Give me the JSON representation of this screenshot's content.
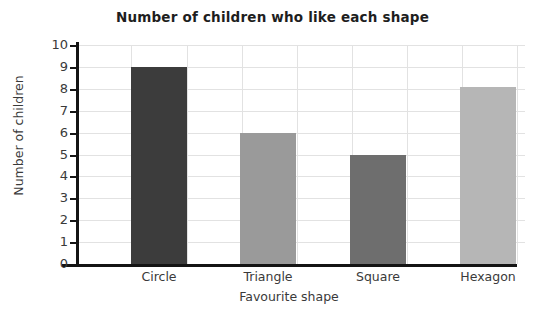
{
  "chart_data": {
    "type": "bar",
    "title": "Number of children who like each shape",
    "xlabel": "Favourite shape",
    "ylabel": "Number of children",
    "categories": [
      "Circle",
      "Triangle",
      "Square",
      "Hexagon"
    ],
    "values": [
      9,
      6,
      5,
      8.1
    ],
    "ylim": [
      0,
      10
    ],
    "yticks": [
      10,
      9,
      8,
      7,
      6,
      5,
      4,
      3,
      2,
      1,
      0
    ],
    "grid": true,
    "legend": "none",
    "bar_colors": [
      "#3c3c3c",
      "#9a9a9a",
      "#6e6e6e",
      "#b6b6b6"
    ],
    "axis_color": "#141414",
    "grid_color": "#e2e2e2",
    "background": "#ffffff"
  }
}
